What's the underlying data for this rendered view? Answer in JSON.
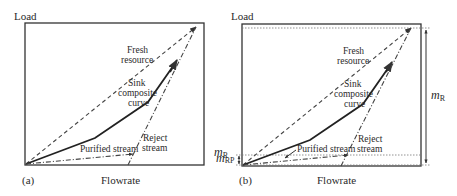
{
  "figure": {
    "panels": [
      {
        "id": "a",
        "panel_label": "(a)",
        "y_axis_label": "Load",
        "x_axis_label": "Flowrate",
        "labels": {
          "fresh_resource_line1": "Fresh",
          "fresh_resource_line2": "resource",
          "sink_line1": "Sink",
          "sink_line2": "composite",
          "sink_line3": "curve",
          "purified_stream": "Purified stream",
          "reject_line1": "Reject",
          "reject_line2": "stream",
          "m_r_symbol": "m",
          "m_r_subscript": "R"
        }
      },
      {
        "id": "b",
        "panel_label": "(b)",
        "y_axis_label": "Load",
        "x_axis_label": "Flowrate",
        "labels": {
          "fresh_resource_line1": "Fresh",
          "fresh_resource_line2": "resource",
          "sink_line1": "Sink",
          "sink_line2": "composite",
          "sink_line3": "curve",
          "purified_stream": "Purified stream",
          "reject_line1": "Reject",
          "reject_line2": "stream",
          "m_r_symbol": "m",
          "m_r_subscript": "R",
          "m_rp_symbol": "m",
          "m_rp_subscript": "RP"
        }
      }
    ]
  }
}
